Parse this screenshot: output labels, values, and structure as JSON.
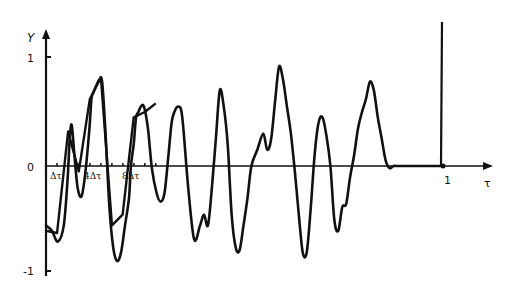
{
  "chart_data": {
    "type": "line",
    "title": "",
    "xlabel": "τ",
    "ylabel": "Y",
    "xlim": [
      0,
      1.1
    ],
    "ylim": [
      -1,
      1
    ],
    "grid": false,
    "legend": null,
    "y_ticks": [
      {
        "value": 1,
        "label": "1"
      },
      {
        "value": 0,
        "label": "0"
      },
      {
        "value": -1,
        "label": "-1"
      }
    ],
    "x_ticks": [
      {
        "value": 0.0278,
        "label": "Δτ"
      },
      {
        "value": 0.1111,
        "label": "4Δτ"
      },
      {
        "value": 0.2222,
        "label": "8Δτ"
      },
      {
        "value": 1,
        "label": "1"
      }
    ],
    "tick_spacing_dt": 0.0278,
    "tick_count": 10,
    "annotations": [
      "Vertical line at τ = 1 rising above Y = 1"
    ],
    "series": [
      {
        "name": "continuous signal",
        "x": [
          0.0,
          0.015,
          0.03,
          0.045,
          0.055,
          0.06,
          0.065,
          0.072,
          0.08,
          0.09,
          0.1,
          0.11,
          0.115,
          0.12,
          0.128,
          0.135,
          0.142,
          0.15,
          0.16,
          0.17,
          0.18,
          0.19,
          0.2,
          0.21,
          0.215,
          0.222,
          0.228,
          0.234,
          0.24,
          0.248,
          0.258,
          0.268,
          0.28,
          0.29,
          0.3,
          0.31,
          0.318,
          0.325,
          0.335,
          0.345,
          0.36,
          0.375,
          0.39,
          0.4,
          0.41,
          0.42,
          0.43,
          0.44,
          0.45,
          0.46,
          0.47,
          0.48,
          0.49,
          0.5,
          0.51,
          0.52,
          0.535,
          0.55,
          0.56,
          0.57,
          0.58,
          0.59,
          0.6,
          0.61,
          0.62,
          0.63,
          0.64,
          0.65,
          0.66,
          0.67,
          0.68,
          0.69,
          0.7,
          0.71,
          0.72,
          0.73,
          0.74,
          0.75,
          0.76,
          0.77,
          0.78,
          0.79,
          0.8,
          0.81,
          0.82,
          0.83,
          0.84,
          0.85,
          0.86,
          0.87,
          0.88,
          0.89,
          0.9,
          0.91,
          0.92,
          0.93,
          0.94,
          0.95,
          0.96,
          0.97,
          0.98,
          0.99,
          1.0
        ],
        "values": [
          -0.55,
          -0.6,
          -0.7,
          -0.55,
          -0.1,
          0.25,
          0.38,
          0.1,
          -0.2,
          -0.28,
          -0.05,
          0.35,
          0.62,
          0.68,
          0.75,
          0.8,
          0.78,
          0.35,
          -0.35,
          -0.75,
          -0.88,
          -0.8,
          -0.55,
          -0.3,
          0.0,
          0.2,
          0.45,
          0.5,
          0.55,
          0.55,
          0.35,
          -0.02,
          -0.25,
          -0.33,
          -0.25,
          0.1,
          0.4,
          0.5,
          0.55,
          0.45,
          -0.2,
          -0.68,
          -0.55,
          -0.45,
          -0.55,
          -0.2,
          0.25,
          0.7,
          0.55,
          0.2,
          -0.45,
          -0.75,
          -0.78,
          -0.55,
          -0.3,
          0.0,
          0.15,
          0.3,
          0.15,
          0.25,
          0.6,
          0.92,
          0.8,
          0.55,
          0.3,
          -0.05,
          -0.45,
          -0.8,
          -0.8,
          -0.4,
          0.1,
          0.4,
          0.45,
          0.28,
          0.0,
          -0.5,
          -0.6,
          -0.38,
          -0.35,
          -0.1,
          0.1,
          0.35,
          0.5,
          0.62,
          0.78,
          0.7,
          0.45,
          0.25,
          0.05,
          -0.02,
          0.0,
          0.0,
          0.0,
          0.0,
          0.0,
          0.0,
          0.0,
          0.0,
          0.0,
          0.0,
          0.0,
          0.0,
          0.0
        ]
      },
      {
        "name": "sampled approximation",
        "x": [
          0.0,
          0.028,
          0.056,
          0.083,
          0.111,
          0.139,
          0.167,
          0.194,
          0.222,
          0.25,
          0.278
        ],
        "values": [
          -0.6,
          -0.62,
          0.32,
          -0.05,
          0.62,
          0.82,
          -0.55,
          -0.45,
          0.45,
          0.5,
          0.58
        ]
      }
    ]
  }
}
